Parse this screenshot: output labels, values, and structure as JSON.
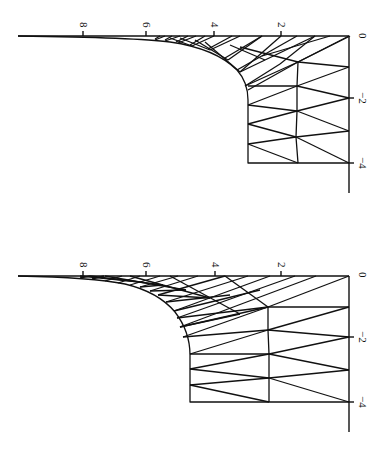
{
  "figures": [
    {
      "id": "top",
      "orientation": "rotated 90 degrees clockwise",
      "axis_horizontal_ticks": [
        "8",
        "6",
        "4",
        "2",
        "0"
      ],
      "axis_vertical_ticks": [
        "0",
        "−2",
        "−4"
      ]
    },
    {
      "id": "bottom",
      "orientation": "rotated 90 degrees clockwise",
      "axis_horizontal_ticks": [
        "8",
        "6",
        "4",
        "2",
        "0"
      ],
      "axis_vertical_ticks": [
        "0",
        "−2",
        "−4"
      ]
    }
  ],
  "labels": {
    "top": {
      "t8": "8",
      "t6": "6",
      "t4": "4",
      "t2": "2",
      "t0": "0",
      "tm2": "−2",
      "tm4": "−4"
    },
    "bottom": {
      "t8": "8",
      "t6": "6",
      "t4": "4",
      "t2": "2",
      "t0": "0",
      "tm2": "−2",
      "tm4": "−4"
    }
  },
  "colors": {
    "ink": "#111111",
    "background": "#ffffff"
  }
}
